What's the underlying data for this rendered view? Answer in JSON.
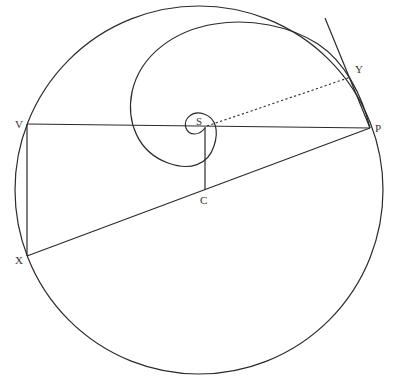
{
  "diagram": {
    "colors": {
      "stroke": "#2b2b2b",
      "label": "#333333",
      "background": "#ffffff"
    },
    "points": {
      "S": {
        "label": "S",
        "x": 205,
        "y": 127
      },
      "P": {
        "label": "P",
        "x": 370,
        "y": 128
      },
      "V": {
        "label": "V",
        "x": 27,
        "y": 124
      },
      "X": {
        "label": "X",
        "x": 27,
        "y": 256
      },
      "C": {
        "label": "C",
        "x": 204,
        "y": 190
      },
      "Y": {
        "label": "Y",
        "x": 351,
        "y": 77
      }
    },
    "circle": {
      "cx": 199,
      "cy": 190,
      "r": 184
    },
    "labels": {
      "S": "S",
      "P": "P",
      "V": "V",
      "X": "X",
      "C": "C",
      "Y": "Y"
    }
  }
}
